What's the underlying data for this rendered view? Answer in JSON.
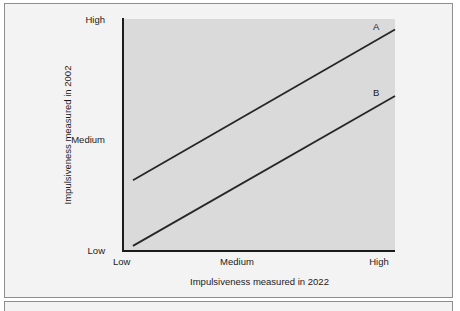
{
  "chart_data": {
    "type": "line",
    "title": "",
    "subtitle": "",
    "xlabel": "Impulsiveness measured in 2022",
    "ylabel": "Impulsiveness measured in 2002",
    "xtick_labels": [
      "Low",
      "Medium",
      "High"
    ],
    "ytick_labels": [
      "Low",
      "Medium",
      "High"
    ],
    "xlim": [
      0,
      1
    ],
    "ylim": [
      0,
      1
    ],
    "grid": false,
    "legend_position": "line-end-labels",
    "annotations": [
      "A",
      "B"
    ],
    "series": [
      {
        "name": "A",
        "label": "A",
        "color": "#262626",
        "x": [
          0.033,
          1.0
        ],
        "y": [
          0.305,
          0.955
        ],
        "points": [
          {
            "x_label": "Low",
            "x": 0.033,
            "y": 0.305
          },
          {
            "x_label": "High",
            "x": 1.0,
            "y": 0.955
          }
        ]
      },
      {
        "name": "B",
        "label": "B",
        "color": "#262626",
        "x": [
          0.033,
          1.0
        ],
        "y": [
          0.022,
          0.668
        ],
        "points": [
          {
            "x_label": "Low",
            "x": 0.033,
            "y": 0.022
          },
          {
            "x_label": "High",
            "x": 1.0,
            "y": 0.668
          }
        ]
      }
    ]
  },
  "figure": {
    "axis_color": "#1b1b1b",
    "plot_background": "#dadada",
    "panel_background": "#f3f3f3",
    "panel_border": "#8e8e8e"
  },
  "axes": {
    "y_title": "Impulsiveness measured in 2002",
    "x_title": "Impulsiveness measured in 2022",
    "y_ticks": {
      "high": "High",
      "medium": "Medium",
      "low": "Low"
    },
    "x_ticks": {
      "low": "Low",
      "medium": "Medium",
      "high": "High"
    }
  },
  "series_labels": {
    "a": "A",
    "b": "B"
  }
}
